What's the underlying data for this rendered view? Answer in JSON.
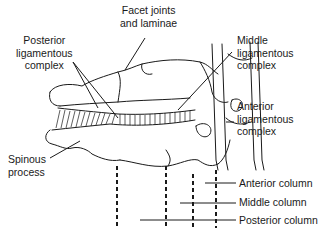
{
  "diagram": {
    "labels": {
      "facet": "Facet joints\nand laminae",
      "posterior_lig": "Posterior\nligamentous\ncomplex",
      "middle_lig": "Middle\nligamentous\ncomplex",
      "anterior_lig": "Anterior\nligamentous\ncomplex",
      "spinous": "Spinous\nprocess",
      "anterior_col": "Anterior column",
      "middle_col": "Middle column",
      "posterior_col": "Posterior column"
    },
    "colors": {
      "ink": "#1a1a1a",
      "background": "#ffffff"
    }
  }
}
